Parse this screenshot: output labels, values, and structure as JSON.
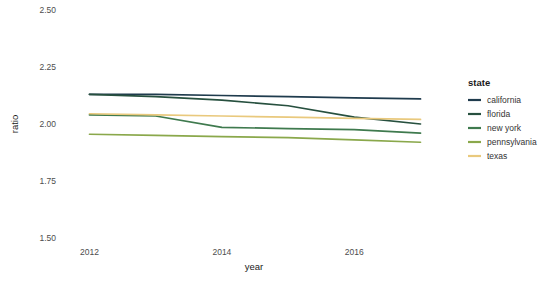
{
  "chart_data": {
    "type": "line",
    "title": "",
    "xlabel": "year",
    "ylabel": "ratio",
    "x": [
      2012,
      2013,
      2014,
      2015,
      2016,
      2017
    ],
    "xlim": [
      2011.6,
      2017.4
    ],
    "ylim": [
      1.5,
      2.5
    ],
    "xticks": [
      2012,
      2014,
      2016
    ],
    "xtick_labels": [
      "2012",
      "2014",
      "2016"
    ],
    "yticks": [
      1.5,
      1.75,
      2.0,
      2.25,
      2.5
    ],
    "ytick_labels": [
      "1.50",
      "1.75",
      "2.00",
      "2.25",
      "2.50"
    ],
    "grid": false,
    "legend_position": "right",
    "legend_title": "state",
    "series": [
      {
        "name": "california",
        "color": "#1f3b4d",
        "values": [
          2.13,
          2.13,
          2.125,
          2.12,
          2.115,
          2.11
        ]
      },
      {
        "name": "florida",
        "color": "#27503f",
        "values": [
          2.13,
          2.12,
          2.105,
          2.08,
          2.03,
          2.0
        ]
      },
      {
        "name": "new york",
        "color": "#3f7a4e",
        "values": [
          2.04,
          2.035,
          1.985,
          1.98,
          1.975,
          1.96
        ]
      },
      {
        "name": "pennsylvania",
        "color": "#8aa84b",
        "values": [
          1.955,
          1.95,
          1.945,
          1.94,
          1.93,
          1.92
        ]
      },
      {
        "name": "texas",
        "color": "#e9c97d",
        "values": [
          2.045,
          2.04,
          2.035,
          2.03,
          2.025,
          2.02
        ]
      }
    ]
  },
  "legend": {
    "title": "state",
    "items": [
      {
        "label": "california",
        "color": "#1f3b4d"
      },
      {
        "label": "florida",
        "color": "#27503f"
      },
      {
        "label": "new york",
        "color": "#3f7a4e"
      },
      {
        "label": "pennsylvania",
        "color": "#8aa84b"
      },
      {
        "label": "texas",
        "color": "#e9c97d"
      }
    ]
  },
  "axes": {
    "x_title": "year",
    "y_title": "ratio"
  },
  "colors": {
    "background": "#ffffff",
    "tick_text": "#4d4d4d",
    "title_text": "#1a1a1a"
  }
}
